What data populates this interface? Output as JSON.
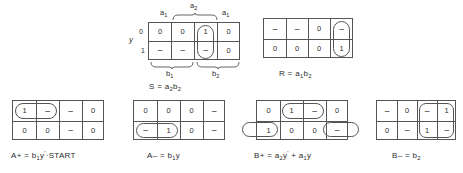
{
  "figure": {
    "type": "karnaugh-map-set"
  },
  "maps": [
    {
      "id": "map-s",
      "name": "S",
      "equation": "S = a",
      "equation_parts": {
        "lhs": "S",
        "op": "=",
        "term1_var": "a",
        "term1_sub": "2",
        "term2_var": "b",
        "term2_sub": "2"
      },
      "top_labels": [
        {
          "text": "a",
          "sub": "1"
        },
        {
          "text": "a",
          "sub": "2"
        },
        {
          "text": "a",
          "sub": "1"
        }
      ],
      "bottom_labels": [
        {
          "text": "b",
          "sub": "1"
        },
        {
          "text": "b",
          "sub": "2"
        }
      ],
      "y_axis_label": "y",
      "row_labels": [
        "0",
        "1"
      ],
      "rows": [
        [
          "0",
          "0",
          "1",
          "0"
        ],
        [
          "–",
          "–",
          "–",
          "0"
        ]
      ],
      "groups": [
        {
          "shape": "oval",
          "col": 3,
          "rows": "both"
        }
      ]
    },
    {
      "id": "map-r",
      "name": "R",
      "equation": "R = a",
      "equation_parts": {
        "lhs": "R",
        "op": "=",
        "term1_var": "a",
        "term1_sub": "1",
        "term2_var": "b",
        "term2_sub": "2"
      },
      "rows": [
        [
          "–",
          "–",
          "0",
          "–"
        ],
        [
          "0",
          "0",
          "0",
          "1"
        ]
      ],
      "groups": [
        {
          "shape": "oval",
          "col": 4,
          "rows": "both"
        }
      ]
    },
    {
      "id": "map-a-plus",
      "name": "A+",
      "equation": "A+ = b",
      "equation_parts": {
        "lhs": "A+",
        "op": "=",
        "term1_var": "b",
        "term1_sub": "1",
        "term2_var": "y",
        "term2_sup": "'",
        "term3": "·START"
      },
      "rows": [
        [
          "1",
          "–",
          "–",
          "0"
        ],
        [
          "0",
          "0",
          "–",
          "0"
        ]
      ],
      "groups": [
        {
          "shape": "oval",
          "cols": "1-2",
          "row": "top"
        }
      ]
    },
    {
      "id": "map-a-minus",
      "name": "A−",
      "equation": "A– = b",
      "equation_parts": {
        "lhs": "A–",
        "op": "=",
        "term1_var": "b",
        "term1_sub": "1",
        "term2_var": "y"
      },
      "rows": [
        [
          "0",
          "0",
          "0",
          "–"
        ],
        [
          "–",
          "1",
          "0",
          "–"
        ]
      ],
      "groups": [
        {
          "shape": "oval",
          "cols": "1-2",
          "row": "bottom"
        }
      ]
    },
    {
      "id": "map-b-plus",
      "name": "B+",
      "equation": "B+ = a",
      "equation_parts": {
        "lhs": "B+",
        "op": "=",
        "term1_var": "a",
        "term1_sub": "2",
        "term2_var": "y",
        "term2_sup": "'",
        "plus": "+",
        "term3_var": "a",
        "term3_sub": "1",
        "term4_var": "y"
      },
      "rows": [
        [
          "0",
          "1",
          "–",
          "0"
        ],
        [
          "1",
          "0",
          "0",
          "–"
        ]
      ],
      "groups": [
        {
          "shape": "oval",
          "cols": "2-3",
          "row": "top"
        },
        {
          "shape": "oval-wrap-left",
          "col": 1,
          "row": "bottom"
        },
        {
          "shape": "oval-wrap-right",
          "col": 4,
          "row": "bottom"
        }
      ]
    },
    {
      "id": "map-b-minus",
      "name": "B−",
      "equation": "B– = b",
      "equation_parts": {
        "lhs": "B–",
        "op": "=",
        "term1_var": "b",
        "term1_sub": "2"
      },
      "rows": [
        [
          "–",
          "0",
          "–",
          "1"
        ],
        [
          "0",
          "–",
          "1",
          "–"
        ]
      ],
      "groups": [
        {
          "shape": "rrect",
          "cols": "3-4",
          "rows": "both"
        }
      ]
    }
  ],
  "equations": {
    "s": {
      "lhs": "S",
      "eq": "=",
      "a": "a",
      "a_sub": "2",
      "b": "b",
      "b_sub": "2"
    },
    "r": {
      "lhs": "R",
      "eq": "=",
      "a": "a",
      "a_sub": "1",
      "b": "b",
      "b_sub": "2"
    },
    "a_plus": {
      "lhs": "A+",
      "eq": "=",
      "b": "b",
      "b_sub": "1",
      "y": "y",
      "y_sup": "'",
      "start": "·START"
    },
    "a_minus": {
      "lhs": "A–",
      "eq": "=",
      "b": "b",
      "b_sub": "1",
      "y": "y"
    },
    "b_plus": {
      "lhs": "B+",
      "eq": "=",
      "a1": "a",
      "a1_sub": "2",
      "y1": "y",
      "y1_sup": "'",
      "plus": "+",
      "a2": "a",
      "a2_sub": "1",
      "y2": "y"
    },
    "b_minus": {
      "lhs": "B–",
      "eq": "=",
      "b": "b",
      "b_sub": "2"
    }
  },
  "axis": {
    "y_label": "y",
    "row0": "0",
    "row1": "1",
    "a1_left": "a",
    "a1_left_sub": "1",
    "a2": "a",
    "a2_sub": "2",
    "a1_right": "a",
    "a1_right_sub": "1",
    "b1": "b",
    "b1_sub": "1",
    "b2": "b",
    "b2_sub": "2"
  },
  "colors": {
    "ink": "#2b2b2b",
    "line": "#555555",
    "background": "#ffffff"
  }
}
